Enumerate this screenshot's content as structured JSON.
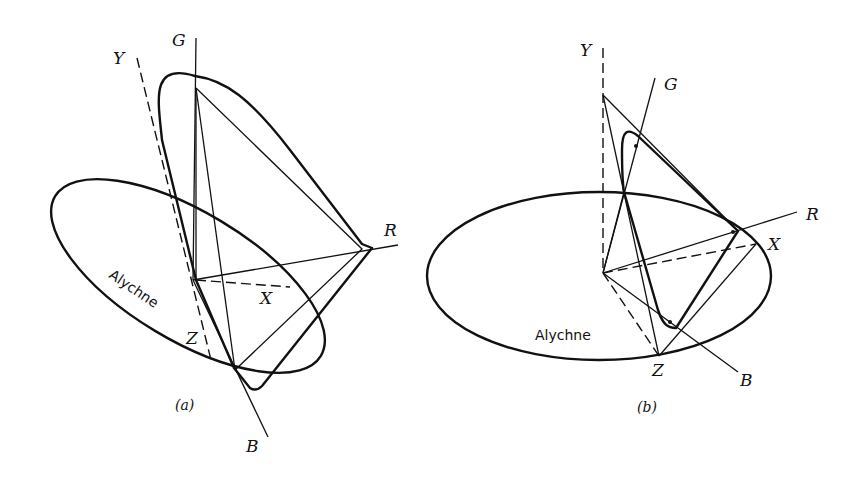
{
  "figure_a": {
    "caption": "(a)",
    "curve_label": "Alychne",
    "axes": {
      "G": "G",
      "Y": "Y",
      "R": "R",
      "X": "X",
      "Z": "Z",
      "B": "B"
    }
  },
  "figure_b": {
    "caption": "(b)",
    "curve_label": "Alychne",
    "axes": {
      "Y": "Y",
      "G": "G",
      "R": "R",
      "X": "X",
      "Z": "Z",
      "B": "B"
    }
  },
  "colors": {
    "ink": "#111111",
    "background": "#ffffff"
  }
}
